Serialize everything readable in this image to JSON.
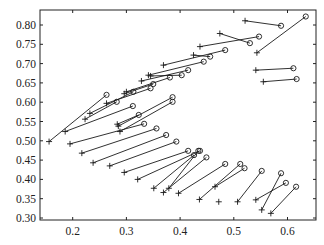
{
  "chart_data": {
    "type": "scatter",
    "title": "",
    "xlabel": "",
    "ylabel": "",
    "xlim": [
      0.14,
      0.65
    ],
    "ylim": [
      0.29,
      0.84
    ],
    "grid": false,
    "legend": null,
    "x_ticks": [
      0.2,
      0.3,
      0.4,
      0.5,
      0.6
    ],
    "x_tick_labels": [
      "0.2",
      "0.3",
      "0.4",
      "0.5",
      "0.6"
    ],
    "y_ticks": [
      0.3,
      0.35,
      0.4,
      0.45,
      0.5,
      0.55,
      0.6,
      0.65,
      0.7,
      0.75,
      0.8
    ],
    "y_tick_labels": [
      "0.30",
      "0.35",
      "0.40",
      "0.45",
      "0.50",
      "0.55",
      "0.60",
      "0.65",
      "0.70",
      "0.75",
      "0.80"
    ],
    "markers": {
      "start": "plus",
      "end": "circle"
    },
    "segments": [
      {
        "plus": [
          0.521,
          0.811
        ],
        "circle": [
          0.588,
          0.798
        ]
      },
      {
        "plus": [
          0.543,
          0.728
        ],
        "circle": [
          0.634,
          0.822
        ]
      },
      {
        "plus": [
          0.474,
          0.778
        ],
        "circle": [
          0.53,
          0.753
        ]
      },
      {
        "plus": [
          0.437,
          0.744
        ],
        "circle": [
          0.547,
          0.77
        ]
      },
      {
        "plus": [
          0.425,
          0.722
        ],
        "circle": [
          0.456,
          0.718
        ]
      },
      {
        "plus": [
          0.369,
          0.696
        ],
        "circle": [
          0.484,
          0.735
        ]
      },
      {
        "plus": [
          0.341,
          0.67
        ],
        "circle": [
          0.444,
          0.705
        ]
      },
      {
        "plus": [
          0.541,
          0.683
        ],
        "circle": [
          0.611,
          0.688
        ]
      },
      {
        "plus": [
          0.555,
          0.653
        ],
        "circle": [
          0.617,
          0.66
        ]
      },
      {
        "plus": [
          0.328,
          0.655
        ],
        "circle": [
          0.415,
          0.683
        ]
      },
      {
        "plus": [
          0.345,
          0.668
        ],
        "circle": [
          0.403,
          0.67
        ]
      },
      {
        "plus": [
          0.3,
          0.627
        ],
        "circle": [
          0.381,
          0.664
        ]
      },
      {
        "plus": [
          0.296,
          0.622
        ],
        "circle": [
          0.35,
          0.647
        ]
      },
      {
        "plus": [
          0.263,
          0.597
        ],
        "circle": [
          0.345,
          0.636
        ]
      },
      {
        "plus": [
          0.232,
          0.571
        ],
        "circle": [
          0.313,
          0.627
        ]
      },
      {
        "plus": [
          0.223,
          0.556
        ],
        "circle": [
          0.282,
          0.601
        ]
      },
      {
        "plus": [
          0.186,
          0.524
        ],
        "circle": [
          0.312,
          0.59
        ]
      },
      {
        "plus": [
          0.156,
          0.498
        ],
        "circle": [
          0.263,
          0.619
        ]
      },
      {
        "plus": [
          0.285,
          0.538
        ],
        "circle": [
          0.386,
          0.613
        ]
      },
      {
        "plus": [
          0.288,
          0.524
        ],
        "circle": [
          0.386,
          0.601
        ]
      },
      {
        "plus": [
          0.283,
          0.543
        ],
        "circle": [
          0.323,
          0.567
        ]
      },
      {
        "plus": [
          0.195,
          0.492
        ],
        "circle": [
          0.333,
          0.544
        ]
      },
      {
        "plus": [
          0.217,
          0.468
        ],
        "circle": [
          0.356,
          0.532
        ]
      },
      {
        "plus": [
          0.238,
          0.443
        ],
        "circle": [
          0.374,
          0.515
        ]
      },
      {
        "plus": [
          0.269,
          0.435
        ],
        "circle": [
          0.393,
          0.498
        ]
      },
      {
        "plus": [
          0.296,
          0.418
        ],
        "circle": [
          0.415,
          0.474
        ]
      },
      {
        "plus": [
          0.321,
          0.4
        ],
        "circle": [
          0.437,
          0.474
        ]
      },
      {
        "plus": [
          0.351,
          0.377
        ],
        "circle": [
          0.426,
          0.463
        ]
      },
      {
        "plus": [
          0.369,
          0.366
        ],
        "circle": [
          0.449,
          0.457
        ]
      },
      {
        "plus": [
          0.379,
          0.377
        ],
        "circle": [
          0.434,
          0.474
        ]
      },
      {
        "plus": [
          0.397,
          0.364
        ],
        "circle": [
          0.484,
          0.44
        ]
      },
      {
        "plus": [
          0.436,
          0.348
        ],
        "circle": [
          0.512,
          0.44
        ]
      },
      {
        "plus": [
          0.465,
          0.381
        ],
        "circle": [
          0.52,
          0.429
        ]
      },
      {
        "plus": [
          0.507,
          0.342
        ],
        "circle": [
          0.552,
          0.422
        ]
      },
      {
        "plus": [
          0.541,
          0.347
        ],
        "circle": [
          0.597,
          0.391
        ]
      },
      {
        "plus": [
          0.552,
          0.321
        ],
        "circle": [
          0.588,
          0.416
        ]
      },
      {
        "plus": [
          0.569,
          0.312
        ],
        "circle": [
          0.616,
          0.381
        ]
      }
    ],
    "isolated_points": [
      {
        "marker": "plus",
        "xy": [
          0.472,
          0.342
        ]
      }
    ]
  }
}
